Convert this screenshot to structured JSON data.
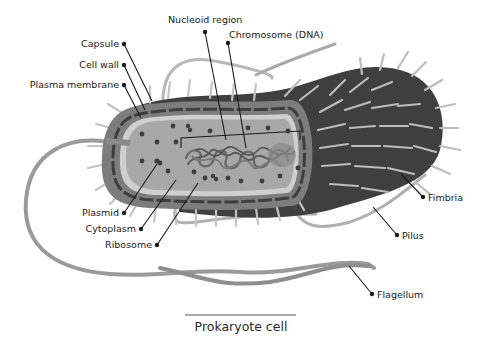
{
  "title": "Prokaryote cell",
  "labels": {
    "nucleoid_region": "Nucleoid region",
    "chromosome": "Chromosome (DNA)",
    "capsule": "Capsule",
    "cell_wall": "Cell wall",
    "plasma_membrane": "Plasma membrane",
    "plasmid": "Plasmid",
    "cytoplasm": "Cytoplasm",
    "ribosome": "Ribosome",
    "fimbria": "Fimbria",
    "pilus": "Pilus",
    "flagellum": "Flagellum"
  },
  "colors": {
    "background": "#ffffff",
    "capsule": "#7a7a7a",
    "cell_wall_band": "#4a4a4a",
    "membrane": "#c9c9c9",
    "cytoplasm": "#a9a9a9",
    "dark_body": "#3c3c3c",
    "appendage": "#b5b5b5",
    "flagellum": "#8e8e8e",
    "leader_line": "#1a1a1a",
    "text": "#1a1a1a"
  }
}
